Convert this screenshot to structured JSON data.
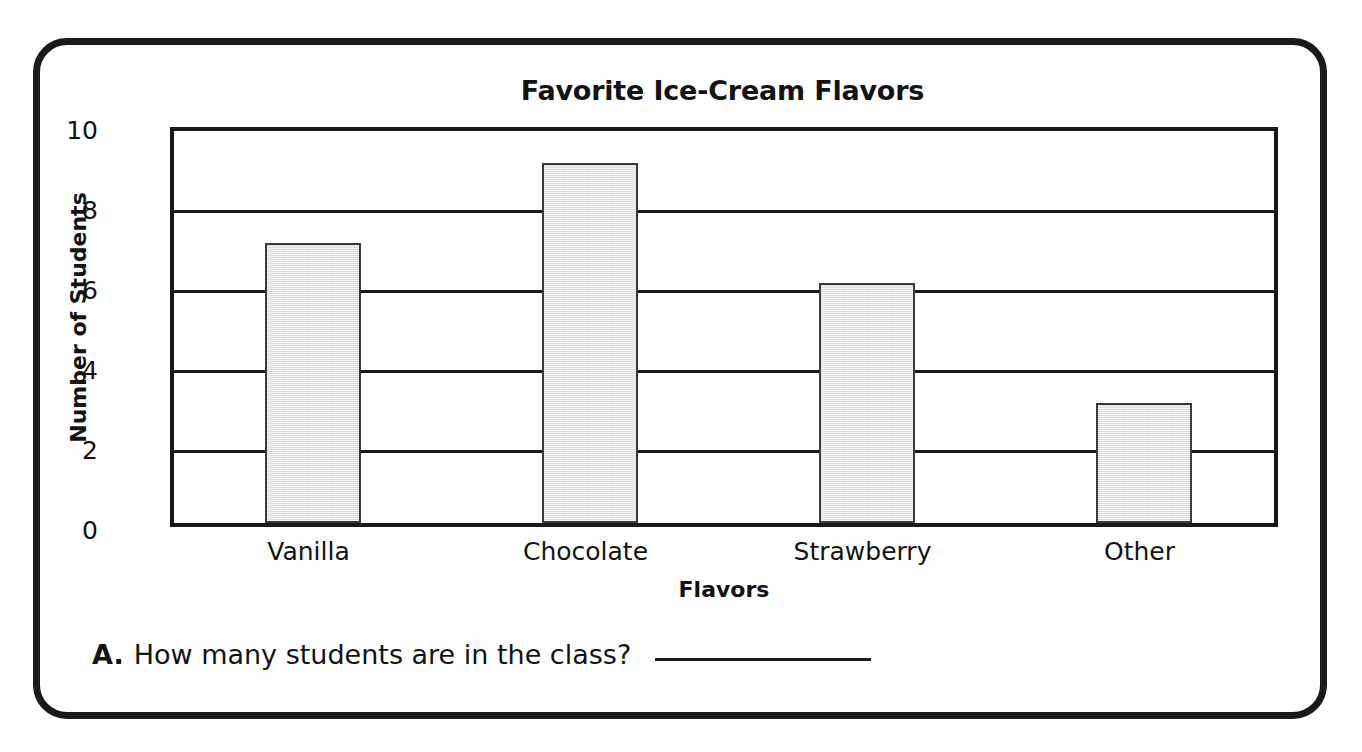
{
  "worksheet": {
    "question": {
      "letter": "A.",
      "text": "How many students are in the class?",
      "answer_value": ""
    }
  },
  "chart_data": {
    "type": "bar",
    "title": "Favorite Ice-Cream Flavors",
    "xlabel": "Flavors",
    "ylabel": "Number of Students",
    "categories": [
      "Vanilla",
      "Chocolate",
      "Strawberry",
      "Other"
    ],
    "values": [
      7,
      9,
      6,
      3
    ],
    "ylim": [
      0,
      10
    ],
    "ytick_labels": [
      "10",
      "8",
      "6",
      "4",
      "2",
      "0"
    ],
    "ytick_values": [
      10,
      8,
      6,
      4,
      2,
      0
    ],
    "grid": true,
    "legend": "none",
    "bar_fill_color": "#e3e3e3",
    "bar_edge_color": "#3a3a3a",
    "axis_color": "#191919"
  }
}
